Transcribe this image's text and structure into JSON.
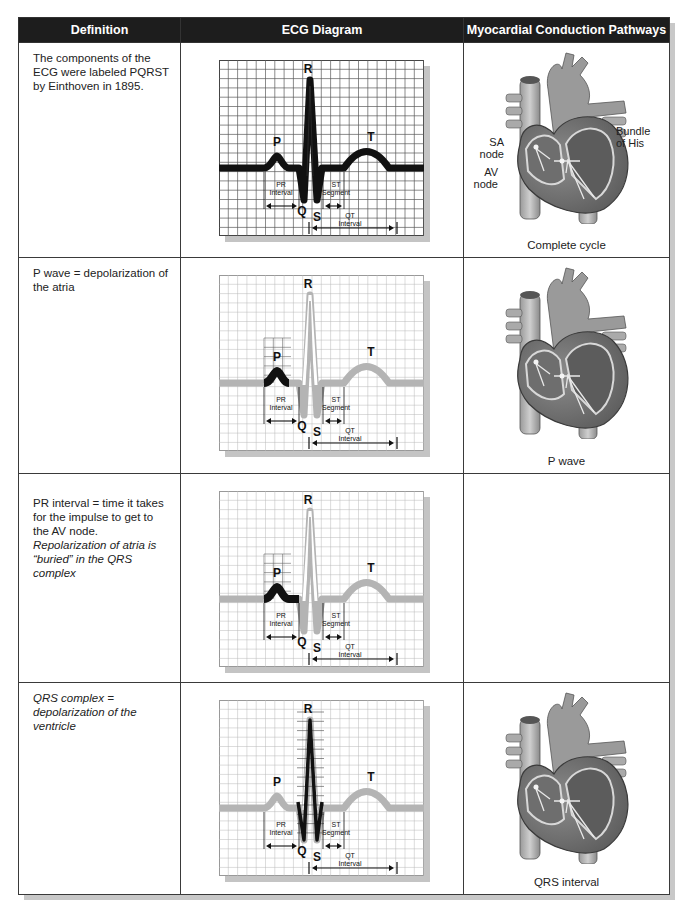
{
  "table": {
    "headers": [
      "Definition",
      "ECG Diagram",
      "Myocardial Conduction Pathways"
    ],
    "rows": [
      {
        "definition": "The components of the ECG were labeled PQRST by Einthoven in 1895.",
        "definition_italic": "",
        "ecg_highlight": "complete",
        "heart_caption": "Complete cycle",
        "heart_labels": {
          "sa": "SA node",
          "av": "AV node",
          "bundle": "Bundle of His"
        }
      },
      {
        "definition": "P wave = depolarization of the atria",
        "definition_italic": "",
        "ecg_highlight": "p-wave",
        "heart_caption": "P wave"
      },
      {
        "definition": "PR interval = time it takes for the impulse to get to the AV node. ",
        "definition_italic": "Repolarization of atria is “buried” in the QRS complex",
        "ecg_highlight": "pr-interval",
        "heart_caption": ""
      },
      {
        "definition": "",
        "definition_italic": "QRS complex = depolarization of the ventricle",
        "ecg_highlight": "qrs-complex",
        "heart_caption": "QRS interval"
      }
    ]
  },
  "ecg_labels": {
    "p": "P",
    "q": "Q",
    "r": "R",
    "s": "S",
    "t": "T",
    "pr_interval": [
      "PR",
      "Interval"
    ],
    "st_segment": [
      "ST",
      "Segment"
    ],
    "qt_interval": [
      "QT",
      "Interval"
    ]
  },
  "colors": {
    "header_bg": "#1d1d1d",
    "grid_dark": "#5a5a5a",
    "grid_light": "#b8b8b8",
    "trace_dark": "#111111",
    "trace_light": "#b4b4b4",
    "heart_fill": "#8a8a8a",
    "heart_dark": "#4d4d4d"
  }
}
